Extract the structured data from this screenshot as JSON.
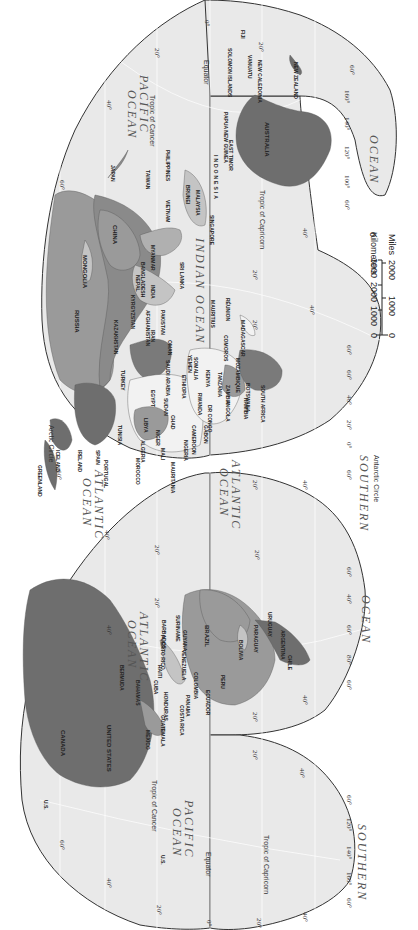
{
  "map": {
    "projection": "interrupted homolosine (rotated 90° clockwise)",
    "colors": {
      "ocean": "#e9e9e9",
      "graticule": "#ffffff",
      "outline": "#333333",
      "land_dark": "#6e6e6e",
      "land_mid": "#9a9a9a",
      "land_light": "#c4c4c4",
      "land_white": "#f2f2f2",
      "background": "#ffffff"
    },
    "oceans": [
      {
        "id": "pacific-ocean-west",
        "label": "PACIFIC\nOCEAN"
      },
      {
        "id": "indian-ocean",
        "label": "INDIAN OCEAN"
      },
      {
        "id": "atlantic-ocean-ne",
        "label": "ATLANTIC\nOCEAN"
      },
      {
        "id": "atlantic-ocean-se",
        "label": "ATLANTIC\nOCEAN"
      },
      {
        "id": "southern-ocean-africa",
        "label": "SOUTHERN"
      },
      {
        "id": "ocean-australia",
        "label": "OCEAN"
      },
      {
        "id": "atlantic-ocean-nw",
        "label": "ATLANTIC\nOCEAN"
      },
      {
        "id": "ocean-south-america",
        "label": "OCEAN"
      },
      {
        "id": "pacific-ocean-east",
        "label": "PACIFIC\nOCEAN"
      },
      {
        "id": "southern-ocean-pacific",
        "label": "SOUTHERN"
      }
    ],
    "lines": {
      "equator": "Equator",
      "tropic_cancer": "Tropic of Cancer",
      "tropic_capricorn": "Tropic of Capricorn",
      "arctic_circle": "Arctic Circle",
      "antarctic_circle": "Antarctic Circle"
    },
    "countries": {
      "japan": "JAPAN",
      "taiwan": "TAIWAN",
      "philippines": "PHILIPPINES",
      "vietnam": "VIETNAM",
      "cambodia": "CAMBODIA",
      "thailand": "THAILAND",
      "brunei": "BRUNEI",
      "malaysia": "MALAYSIA",
      "singapore": "SINGAPORE",
      "indonesia": "INDONESIA",
      "east_timor": "EAST TIMOR",
      "papua_new_guinea": "PAPUA NEW GUINEA",
      "solomon_islands": "SOLOMON ISLANDS",
      "vanuatu": "VANUATU",
      "new_caledonia": "NEW CALEDONIA",
      "fiji": "FIJI",
      "new_zealand": "NEW ZEALAND",
      "australia": "AUSTRALIA",
      "china": "CHINA",
      "mongolia": "MONGOLIA",
      "russia": "RUSSIA",
      "kazakhstan": "KAZAKHSTAN",
      "kyrgyzstan": "KYRGYZSTAN",
      "tajikistan": "TAJIKISTAN",
      "uzbekistan": "UZBEKISTAN",
      "turkmenistan": "TURKMENISTAN",
      "afghanistan": "AFGHANISTAN",
      "pakistan": "PAKISTAN",
      "iran": "IRAN",
      "iraq": "IRAQ",
      "saudi_arabia": "SAUDI ARABIA",
      "yemen": "YEMEN",
      "oman": "OMAN",
      "india": "INDIA",
      "nepal": "NEPAL",
      "bhutan": "BHUTAN",
      "bangladesh": "BANGLADESH",
      "myanmar": "MYANMAR",
      "sri_lanka": "SRI LANKA",
      "turkey": "TURKEY",
      "egypt": "EGYPT",
      "libya": "LIBYA",
      "algeria": "ALGERIA",
      "tunisia": "TUNISIA",
      "morocco": "MOROCCO",
      "portugal": "PORTUGAL",
      "spain": "SPAIN",
      "iceland": "ICELAND",
      "greenland": "GREENLAND",
      "norway": "NORWAY",
      "sweden": "SWEDEN",
      "finland": "FINLAND",
      "ireland": "IRELAND",
      "united_kingdom": "UNITED KINGDOM",
      "mauritania": "MAURITANIA",
      "mali": "MALI",
      "niger": "NIGER",
      "chad": "CHAD",
      "sudan": "SUDAN",
      "ethiopia": "ETHIOPIA",
      "somalia": "SOMALIA",
      "kenya": "KENYA",
      "tanzania": "TANZANIA",
      "senegal": "SENEGAL",
      "gambia": "GAMBIA",
      "guinea_bissau": "GUINEA-BISSAU",
      "guinea": "GUINEA",
      "sierra_leone": "SIERRA LEONE",
      "liberia": "LIBERIA",
      "nigeria": "NIGERIA",
      "cameroon": "CAMEROON",
      "equatorial_guinea": "EQUATORIAL GUINEA",
      "gabon": "GABON",
      "congo": "CONGO",
      "dr_congo": "DR CONGO",
      "rwanda": "RWANDA",
      "burundi": "BURUNDI",
      "angola": "ANGOLA",
      "zambia": "ZAMBIA",
      "malawi": "MALAWI",
      "mozambique": "MOZAMBIQUE",
      "zimbabwe": "ZIMBABWE",
      "namibia": "NAMIBIA",
      "botswana": "BOTSWANA",
      "south_africa": "SOUTH AFRICA",
      "lesotho": "LESOTHO",
      "swaziland": "SWAZILAND",
      "madagascar": "MADAGASCAR",
      "comoros": "COMOROS",
      "mauritius": "MAURITIUS",
      "reunion": "RÉUNION",
      "canada": "CANADA",
      "united_states": "UNITED STATES",
      "us_alaska": "U.S.\n(Alaska)",
      "us_hawaii": "U.S.\n(Hawaii)",
      "mexico": "MEXICO",
      "bermuda": "BERMUDA",
      "bahamas": "BAHAMAS",
      "cuba": "CUBA",
      "jamaica": "JAMAICA",
      "haiti": "HAITI",
      "dominican_republic": "DOMINICAN REPUBLIC",
      "puerto_rico": "PUERTO RICO",
      "belize": "BELIZE",
      "guatemala": "GUATEMALA",
      "el_salvador": "EL SALVADOR",
      "honduras": "HONDURAS",
      "nicaragua": "NICARAGUA",
      "costa_rica": "COSTA RICA",
      "panama": "PANAMA",
      "barbados": "BARBADOS",
      "trinidad_tobago": "TRINIDAD AND TOBAGO",
      "venezuela": "VENEZUELA",
      "guyana": "GUYANA",
      "suriname": "SURINAME",
      "french_guiana": "FRENCH GUIANA",
      "colombia": "COLOMBIA",
      "ecuador": "ECUADOR",
      "peru": "PERU",
      "brazil": "BRAZIL",
      "bolivia": "BOLIVIA",
      "paraguay": "PARAGUAY",
      "uruguay": "URUGUAY",
      "argentina": "ARGENTINA",
      "chile": "CHILE"
    },
    "degree_labels": {
      "d0": "0°",
      "d20": "20°",
      "d40": "40°",
      "d60": "60°",
      "d80": "80°",
      "d100": "100°",
      "d120": "120°",
      "d140": "140°",
      "d160": "160°"
    },
    "scale_bar": {
      "km_label": "0   1000  2000  3000 Kilometers",
      "mi_label": "0      1000      2000 Miles",
      "km_ticks": [
        "0",
        "1000",
        "2000",
        "3000"
      ],
      "km_unit": "Kilometers",
      "mi_ticks": [
        "0",
        "1000",
        "2000"
      ],
      "mi_unit": "Miles"
    }
  }
}
